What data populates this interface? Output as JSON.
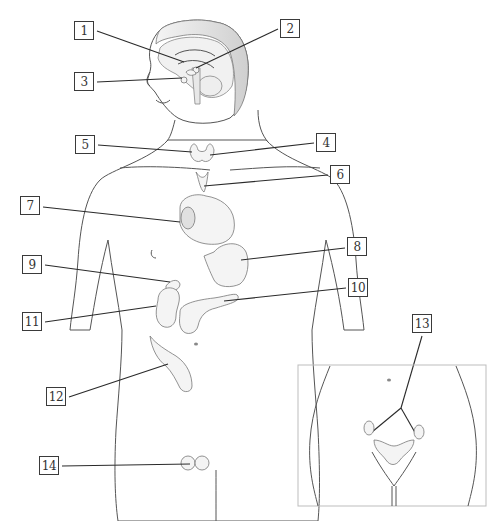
{
  "diagram": {
    "type": "anatomical-labeling",
    "labels": [
      {
        "id": "1",
        "text": "1",
        "x": 74,
        "y": 21
      },
      {
        "id": "2",
        "text": "2",
        "x": 280,
        "y": 19
      },
      {
        "id": "3",
        "text": "3",
        "x": 74,
        "y": 72
      },
      {
        "id": "4",
        "text": "4",
        "x": 316,
        "y": 133
      },
      {
        "id": "5",
        "text": "5",
        "x": 75,
        "y": 135
      },
      {
        "id": "6",
        "text": "6",
        "x": 330,
        "y": 165
      },
      {
        "id": "7",
        "text": "7",
        "x": 20,
        "y": 196
      },
      {
        "id": "8",
        "text": "8",
        "x": 347,
        "y": 237
      },
      {
        "id": "9",
        "text": "9",
        "x": 22,
        "y": 255
      },
      {
        "id": "10",
        "text": "10",
        "x": 348,
        "y": 278
      },
      {
        "id": "11",
        "text": "11",
        "x": 22,
        "y": 312
      },
      {
        "id": "12",
        "text": "12",
        "x": 46,
        "y": 387
      },
      {
        "id": "13",
        "text": "13",
        "x": 412,
        "y": 313
      },
      {
        "id": "14",
        "text": "14",
        "x": 39,
        "y": 456
      }
    ],
    "inset": {
      "x": 298,
      "y": 365,
      "width": 188,
      "height": 141
    }
  },
  "colors": {
    "line": "#2a2a2a",
    "outline": "#555555",
    "shade": "#ececec",
    "box_border": "#3a3a3a"
  }
}
